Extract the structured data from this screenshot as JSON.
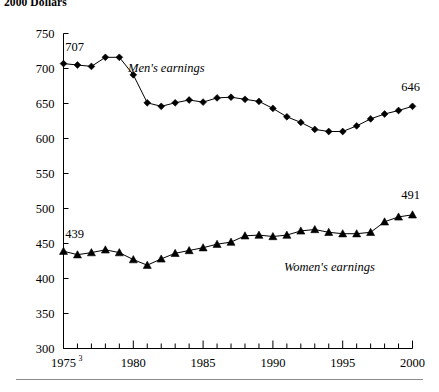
{
  "figure": {
    "caption": "2000 Dollars"
  },
  "chart_data": {
    "type": "line",
    "title": "2000 Dollars",
    "xlabel": "",
    "ylabel": "",
    "xlim": [
      1975,
      2000
    ],
    "ylim": [
      300,
      750
    ],
    "yticks": [
      300,
      350,
      400,
      450,
      500,
      550,
      600,
      650,
      700,
      750
    ],
    "xticks": [
      1975,
      1980,
      1985,
      1990,
      1995,
      2000
    ],
    "xtick_labels": [
      "1975",
      "1980",
      "1985",
      "1990",
      "1995",
      "2000"
    ],
    "xtick_superscripts": [
      "3",
      "",
      "",
      "",
      "",
      ""
    ],
    "minor_xticks_every": 1,
    "grid": false,
    "legend_position": "inline-annotation",
    "x": [
      1975,
      1976,
      1977,
      1978,
      1979,
      1980,
      1981,
      1982,
      1983,
      1984,
      1985,
      1986,
      1987,
      1988,
      1989,
      1990,
      1991,
      1992,
      1993,
      1994,
      1995,
      1996,
      1997,
      1998,
      1999,
      2000
    ],
    "series": [
      {
        "name": "Men's earnings",
        "marker": "diamond",
        "label_text": "Men's earnings",
        "endpoint_labels": {
          "start": "707",
          "end": "646"
        },
        "values": [
          707,
          705,
          703,
          716,
          716,
          691,
          651,
          646,
          651,
          655,
          652,
          658,
          659,
          656,
          653,
          643,
          631,
          623,
          613,
          610,
          610,
          618,
          628,
          635,
          640,
          646
        ]
      },
      {
        "name": "Women's earnings",
        "marker": "triangle",
        "label_text": "Women's earnings",
        "endpoint_labels": {
          "start": "439",
          "end": "491"
        },
        "values": [
          439,
          434,
          437,
          441,
          437,
          427,
          419,
          428,
          436,
          440,
          444,
          449,
          452,
          461,
          462,
          460,
          462,
          468,
          470,
          466,
          464,
          464,
          466,
          481,
          488,
          491
        ]
      }
    ]
  }
}
